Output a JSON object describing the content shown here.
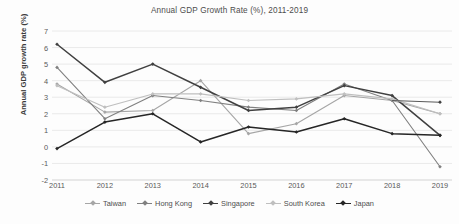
{
  "chart_data": {
    "type": "line",
    "title": "Annual GDP Growth Rate (%), 2011-2019",
    "xlabel": "",
    "ylabel": "Annual GDP growth rate (%)",
    "categories": [
      "2011",
      "2012",
      "2013",
      "2014",
      "2015",
      "2016",
      "2017",
      "2018",
      "2019"
    ],
    "ylim": [
      -2,
      7
    ],
    "yticks": [
      7,
      6,
      5,
      4,
      3,
      2,
      1,
      0,
      -1,
      -2
    ],
    "grid": true,
    "legend_position": "bottom",
    "series": [
      {
        "name": "Taiwan",
        "color": "#a6a6a6",
        "values": [
          3.8,
          2.1,
          2.2,
          4.0,
          0.8,
          1.4,
          3.1,
          2.8,
          2.0
        ]
      },
      {
        "name": "Hong Kong",
        "color": "#808080",
        "values": [
          4.8,
          1.7,
          3.1,
          2.8,
          2.4,
          2.2,
          3.8,
          2.8,
          -1.2
        ]
      },
      {
        "name": "Singapore",
        "color": "#404040",
        "values": [
          6.2,
          3.9,
          5.0,
          3.6,
          2.2,
          2.4,
          3.7,
          3.1,
          0.7
        ]
      },
      {
        "name": "South Korea",
        "color": "#bfbfbf",
        "values": [
          3.7,
          2.4,
          3.2,
          3.2,
          2.8,
          2.9,
          3.2,
          2.9,
          2.0
        ]
      },
      {
        "name": "Japan",
        "color": "#262626",
        "values": [
          -0.1,
          1.5,
          2.0,
          0.3,
          1.2,
          0.9,
          1.7,
          0.8,
          0.7
        ]
      }
    ],
    "extra_series_note": "",
    "japan_2019_marker": 2.7
  },
  "axis": {
    "y_tick_labels": [
      "7",
      "6",
      "5",
      "4",
      "3",
      "2",
      "1",
      "0",
      "-1",
      "-2"
    ],
    "x_tick_labels": [
      "2011",
      "2012",
      "2013",
      "2014",
      "2015",
      "2016",
      "2017",
      "2018",
      "2019"
    ]
  },
  "legend": {
    "items": [
      {
        "label": "Taiwan"
      },
      {
        "label": "Hong Kong"
      },
      {
        "label": "Singapore"
      },
      {
        "label": "South Korea"
      },
      {
        "label": "Japan"
      }
    ]
  }
}
